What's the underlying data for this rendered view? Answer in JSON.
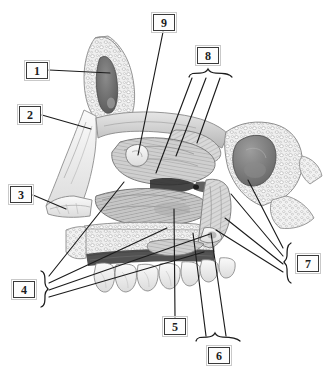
{
  "figure": {
    "kind": "labeled-anatomical-illustration",
    "rendering": "grayscale pencil / halftone engraving",
    "width_px": 325,
    "height_px": 372,
    "background_color": "#ffffff",
    "line_color": "#1c1c1c",
    "box_border_color": "#3a3a3a",
    "box_outer_border_color": "#c9c9c9",
    "box_fill_color": "#fdfdfd"
  },
  "labels": [
    {
      "id": "1",
      "text": "1",
      "box": {
        "x": 26,
        "y": 62,
        "w": 22,
        "h": 17
      },
      "connector": "single-line",
      "leaders": [
        {
          "x1": 49,
          "y1": 70,
          "x2": 110,
          "y2": 73
        }
      ]
    },
    {
      "id": "2",
      "text": "2",
      "box": {
        "x": 19,
        "y": 106,
        "w": 22,
        "h": 17
      },
      "connector": "single-line",
      "leaders": [
        {
          "x1": 42,
          "y1": 115,
          "x2": 91,
          "y2": 129
        }
      ]
    },
    {
      "id": "3",
      "text": "3",
      "box": {
        "x": 10,
        "y": 186,
        "w": 22,
        "h": 17
      },
      "connector": "single-line",
      "leaders": [
        {
          "x1": 33,
          "y1": 195,
          "x2": 66,
          "y2": 209
        }
      ]
    },
    {
      "id": "4",
      "text": "4",
      "box": {
        "x": 13,
        "y": 281,
        "w": 22,
        "h": 17
      },
      "connector": "brace-right",
      "brace": {
        "x": 41,
        "y_top": 271,
        "y_bottom": 307,
        "depth": 7
      },
      "leaders": [
        {
          "x1": 48,
          "y1": 275,
          "x2": 124,
          "y2": 182
        },
        {
          "x1": 48,
          "y1": 283,
          "x2": 167,
          "y2": 228
        },
        {
          "x1": 48,
          "y1": 291,
          "x2": 210,
          "y2": 234
        },
        {
          "x1": 48,
          "y1": 300,
          "x2": 204,
          "y2": 252
        }
      ]
    },
    {
      "id": "5",
      "text": "5",
      "box": {
        "x": 164,
        "y": 318,
        "w": 22,
        "h": 17
      },
      "connector": "single-line",
      "leaders": [
        {
          "x1": 175,
          "y1": 318,
          "x2": 174,
          "y2": 209
        }
      ]
    },
    {
      "id": "6",
      "text": "6",
      "box": {
        "x": 208,
        "y": 349,
        "w": 22,
        "h": 17
      },
      "connector": "brace-up",
      "brace": {
        "x_left": 196,
        "x_right": 240,
        "y": 341,
        "depth": 7
      },
      "leaders": [
        {
          "x1": 207,
          "y1": 338,
          "x2": 193,
          "y2": 233
        },
        {
          "x1": 229,
          "y1": 338,
          "x2": 210,
          "y2": 233
        }
      ]
    },
    {
      "id": "7",
      "text": "7",
      "box": {
        "x": 297,
        "y": 255,
        "w": 22,
        "h": 17
      },
      "connector": "brace-left",
      "brace": {
        "x": 289,
        "y_top": 243,
        "y_bottom": 283,
        "depth": 7
      },
      "leaders": [
        {
          "x1": 282,
          "y1": 248,
          "x2": 248,
          "y2": 180
        },
        {
          "x1": 282,
          "y1": 256,
          "x2": 231,
          "y2": 194
        },
        {
          "x1": 282,
          "y1": 265,
          "x2": 225,
          "y2": 218
        },
        {
          "x1": 282,
          "y1": 274,
          "x2": 216,
          "y2": 230
        }
      ]
    },
    {
      "id": "8",
      "text": "8",
      "box": {
        "x": 197,
        "y": 47,
        "w": 22,
        "h": 17
      },
      "connector": "brace-down",
      "brace": {
        "x_left": 189,
        "x_right": 229,
        "y": 72,
        "depth": 7
      },
      "leaders": [
        {
          "x1": 194,
          "y1": 79,
          "x2": 156,
          "y2": 173
        },
        {
          "x1": 207,
          "y1": 79,
          "x2": 176,
          "y2": 156
        },
        {
          "x1": 221,
          "y1": 79,
          "x2": 197,
          "y2": 143
        }
      ]
    },
    {
      "id": "9",
      "text": "9",
      "box": {
        "x": 153,
        "y": 14,
        "w": 22,
        "h": 17
      },
      "connector": "single-line",
      "leaders": [
        {
          "x1": 162,
          "y1": 31,
          "x2": 138,
          "y2": 155
        }
      ]
    }
  ]
}
